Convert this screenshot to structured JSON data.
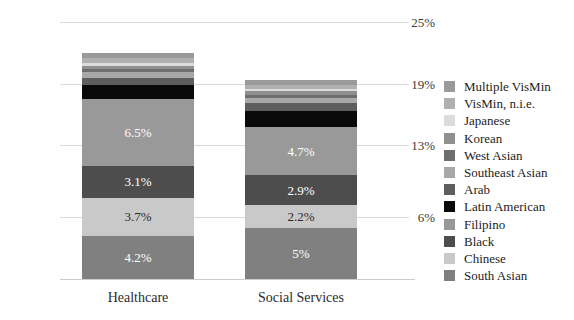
{
  "chart_data": {
    "type": "bar",
    "stacked": true,
    "title": "",
    "xlabel": "",
    "ylabel": "",
    "categories": [
      "Healthcare",
      "Social Services"
    ],
    "ylim": [
      0,
      25
    ],
    "yticks": [
      6,
      13,
      19,
      25
    ],
    "ytick_labels": [
      "6%",
      "13%",
      "19%",
      "25%"
    ],
    "grid": true,
    "legend_position": "right",
    "legend_order_top_to_bottom": [
      "Multiple VisMin",
      "VisMin, n.i.e.",
      "Japanese",
      "Korean",
      "West Asian",
      "Southeast Asian",
      "Arab",
      "Latin American",
      "Filipino",
      "Black",
      "Chinese",
      "South Asian"
    ],
    "series": [
      {
        "name": "South Asian",
        "color": "#808080",
        "values": [
          4.2,
          5.0
        ],
        "labels": [
          "4.2%",
          "5%"
        ],
        "label_color": "#ffffff"
      },
      {
        "name": "Chinese",
        "color": "#c9c9c9",
        "values": [
          3.7,
          2.2
        ],
        "labels": [
          "3.7%",
          "2.2%"
        ],
        "label_color": "#2b2b2b"
      },
      {
        "name": "Black",
        "color": "#4d4d4d",
        "values": [
          3.1,
          2.9
        ],
        "labels": [
          "3.1%",
          "2.9%"
        ],
        "label_color": "#ffffff"
      },
      {
        "name": "Filipino",
        "color": "#999999",
        "values": [
          6.5,
          4.7
        ],
        "labels": [
          "6.5%",
          "4.7%"
        ],
        "label_color": "#ffffff"
      },
      {
        "name": "Latin American",
        "color": "#0a0a0a",
        "values": [
          1.35,
          1.55
        ],
        "labels": [
          "",
          ""
        ],
        "label_color": "#ffffff"
      },
      {
        "name": "Arab",
        "color": "#5e5e5e",
        "values": [
          0.75,
          0.8
        ],
        "labels": [
          "",
          ""
        ],
        "label_color": "#ffffff"
      },
      {
        "name": "Southeast Asian",
        "color": "#a8a8a8",
        "values": [
          0.5,
          0.45
        ],
        "labels": [
          "",
          ""
        ],
        "label_color": "#ffffff"
      },
      {
        "name": "West Asian",
        "color": "#6e6e6e",
        "values": [
          0.35,
          0.35
        ],
        "labels": [
          "",
          ""
        ],
        "label_color": "#ffffff"
      },
      {
        "name": "Korean",
        "color": "#909090",
        "values": [
          0.3,
          0.3
        ],
        "labels": [
          "",
          ""
        ],
        "label_color": "#ffffff"
      },
      {
        "name": "Japanese",
        "color": "#dcdcdc",
        "values": [
          0.3,
          0.25
        ],
        "labels": [
          "",
          ""
        ],
        "label_color": "#2b2b2b"
      },
      {
        "name": "VisMin, n.i.e.",
        "color": "#b0b0b0",
        "values": [
          0.45,
          0.4
        ],
        "labels": [
          "",
          ""
        ],
        "label_color": "#ffffff"
      },
      {
        "name": "Multiple VisMin",
        "color": "#9a9a9a",
        "values": [
          0.45,
          0.45
        ],
        "labels": [
          "",
          ""
        ],
        "label_color": "#ffffff"
      }
    ],
    "totals": [
      21.95,
      19.3
    ]
  },
  "legend": {
    "items": [
      {
        "label": "Multiple VisMin",
        "color": "#9a9a9a"
      },
      {
        "label": "VisMin, n.i.e.",
        "color": "#b0b0b0"
      },
      {
        "label": "Japanese",
        "color": "#dcdcdc"
      },
      {
        "label": "Korean",
        "color": "#909090"
      },
      {
        "label": "West Asian",
        "color": "#6e6e6e"
      },
      {
        "label": "Southeast Asian",
        "color": "#a8a8a8"
      },
      {
        "label": "Arab",
        "color": "#5e5e5e"
      },
      {
        "label": "Latin American",
        "color": "#0a0a0a"
      },
      {
        "label": "Filipino",
        "color": "#999999"
      },
      {
        "label": "Black",
        "color": "#4d4d4d"
      },
      {
        "label": "Chinese",
        "color": "#c9c9c9"
      },
      {
        "label": "South Asian",
        "color": "#808080"
      }
    ]
  }
}
